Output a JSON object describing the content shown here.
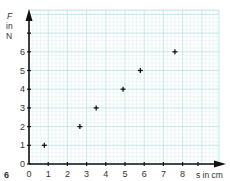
{
  "figure": {
    "number": "6"
  },
  "chart_data": {
    "type": "scatter",
    "title": "",
    "xlabel": "s in cm",
    "ylabel_lines": [
      "F",
      "in",
      "N"
    ],
    "ylabel": "F in N",
    "xlim": [
      0,
      8.5
    ],
    "ylim": [
      0,
      7.5
    ],
    "x_ticks": [
      "0",
      "1",
      "2",
      "3",
      "4",
      "5",
      "6",
      "7",
      "8"
    ],
    "y_ticks": [
      "0",
      "1",
      "2",
      "3",
      "4",
      "5",
      "6"
    ],
    "grid": true,
    "marker": "+",
    "series": [
      {
        "name": "measurements",
        "points": [
          {
            "x": 0.8,
            "y": 1
          },
          {
            "x": 2.65,
            "y": 2
          },
          {
            "x": 3.5,
            "y": 3
          },
          {
            "x": 4.9,
            "y": 4
          },
          {
            "x": 5.8,
            "y": 5
          },
          {
            "x": 7.6,
            "y": 6
          }
        ]
      }
    ]
  },
  "colors": {
    "grid_minor": "#dcefef",
    "grid_major": "#b9dfe3",
    "axis": "#111111",
    "marker": "#111111",
    "text": "#333333"
  }
}
